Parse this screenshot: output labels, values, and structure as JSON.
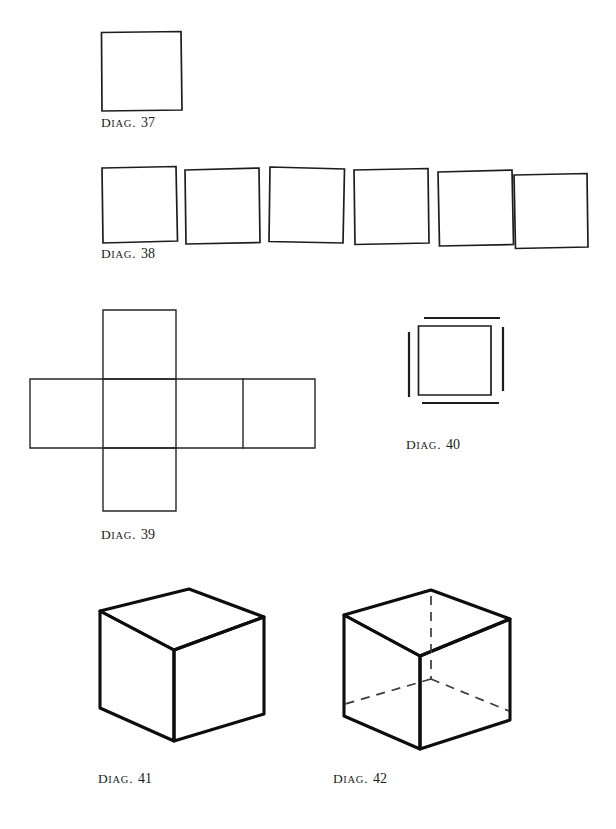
{
  "page": {
    "width": 616,
    "height": 829,
    "background": "#ffffff",
    "ink": "#1a1a1a"
  },
  "figures": [
    {
      "id": "diag-37",
      "caption_lead": "D",
      "caption_small": "IAG",
      "caption_dot": ".",
      "caption_number": "37",
      "caption_full": "Diag. 37",
      "description": "single square",
      "shape": "square"
    },
    {
      "id": "diag-38",
      "caption_lead": "D",
      "caption_small": "IAG",
      "caption_dot": ".",
      "caption_number": "38",
      "caption_full": "Diag. 38",
      "description": "row of six squares",
      "shape": "square-row",
      "count": 6
    },
    {
      "id": "diag-39",
      "caption_lead": "D",
      "caption_small": "IAG",
      "caption_dot": ".",
      "caption_number": "39",
      "caption_full": "Diag. 39",
      "description": "cross shaped cube net of six squares",
      "shape": "cube-net",
      "count": 6
    },
    {
      "id": "diag-40",
      "caption_lead": "D",
      "caption_small": "IAG",
      "caption_dot": ".",
      "caption_number": "40",
      "caption_full": "Diag. 40",
      "description": "square with four detached outer lines",
      "shape": "square-with-offset-lines"
    },
    {
      "id": "diag-41",
      "caption_lead": "D",
      "caption_small": "IAG",
      "caption_dot": ".",
      "caption_number": "41",
      "caption_full": "Diag. 41",
      "description": "opaque cube in two point perspective",
      "shape": "cube-solid"
    },
    {
      "id": "diag-42",
      "caption_lead": "D",
      "caption_small": "IAG",
      "caption_dot": ".",
      "caption_number": "42",
      "caption_full": "Diag. 42",
      "description": "transparent cube with dashed hidden edges",
      "shape": "cube-transparent"
    }
  ]
}
